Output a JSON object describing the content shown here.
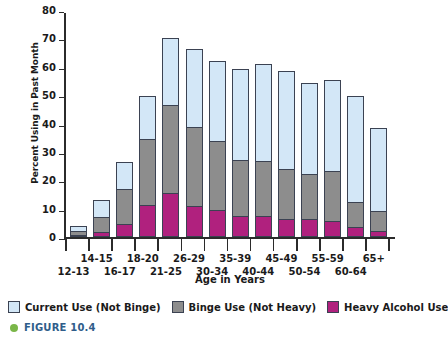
{
  "chart_data": {
    "type": "bar",
    "stacked": true,
    "title": "",
    "xlabel": "Age in Years",
    "ylabel": "Percent Using in Past Month",
    "ylim": [
      0,
      80
    ],
    "yticks": [
      0,
      10,
      20,
      30,
      40,
      50,
      60,
      70,
      80
    ],
    "ytick_labels": [
      "0",
      "10",
      "20",
      "30",
      "40",
      "50",
      "60",
      "70",
      "80"
    ],
    "grid": false,
    "legend_position": "below",
    "categories": [
      "12-13",
      "14-15",
      "16-17",
      "18-20",
      "21-25",
      "26-29",
      "30-34",
      "35-39",
      "40-44",
      "45-49",
      "50-54",
      "55-59",
      "60-64",
      "65+"
    ],
    "series": [
      {
        "name": "Heavy Alcohol Use",
        "color": "#b0217e",
        "values": [
          0.4,
          1.8,
          4.5,
          11.4,
          15.4,
          10.8,
          9.5,
          7.4,
          7.5,
          6.5,
          6.2,
          5.6,
          3.5,
          2.0
        ]
      },
      {
        "name": "Binge Use (Not Heavy)",
        "color": "#8d8d8d",
        "values": [
          1.3,
          5.4,
          12.5,
          23.1,
          31.2,
          28.0,
          24.4,
          19.7,
          19.2,
          17.4,
          16.1,
          17.5,
          8.7,
          7.3
        ]
      },
      {
        "name": "Current Use (Not Binge)",
        "color": "#d3e7f7",
        "values": [
          1.8,
          6.0,
          9.3,
          15.3,
          23.5,
          27.4,
          28.3,
          32.1,
          34.3,
          34.7,
          32.1,
          32.2,
          37.5,
          29.2
        ]
      }
    ],
    "totals": [
      3.5,
      13.2,
      26.3,
      49.8,
      70.1,
      66.2,
      62.2,
      59.2,
      61.0,
      58.6,
      54.4,
      55.3,
      49.7,
      38.5
    ],
    "cumulative_tops": {
      "heavy": [
        0.4,
        1.8,
        4.5,
        11.4,
        15.4,
        10.8,
        9.5,
        7.4,
        7.5,
        6.5,
        6.2,
        5.6,
        3.5,
        2.0
      ],
      "binge": [
        1.7,
        7.2,
        17.0,
        34.5,
        46.6,
        38.8,
        33.9,
        27.1,
        26.7,
        23.9,
        22.3,
        23.1,
        12.2,
        9.3
      ],
      "current": [
        3.5,
        13.2,
        26.3,
        49.8,
        70.1,
        66.2,
        62.2,
        59.2,
        61.0,
        58.6,
        54.4,
        55.3,
        49.7,
        38.5
      ]
    }
  },
  "axes": {
    "y_title": "Percent Using in Past Month",
    "x_title": "Age in Years"
  },
  "legend": {
    "items": [
      {
        "label": "Current Use (Not Binge)",
        "color": "#d3e7f7",
        "swatch": "legend-swatch-current-use"
      },
      {
        "label": "Binge Use (Not Heavy)",
        "color": "#8d8d8d",
        "swatch": "legend-swatch-binge-use"
      },
      {
        "label": "Heavy Alcohol Use",
        "color": "#b0217e",
        "swatch": "legend-swatch-heavy-use"
      }
    ]
  },
  "caption": {
    "bullet_color": "#7ab648",
    "text": "FIGURE 10.4"
  }
}
